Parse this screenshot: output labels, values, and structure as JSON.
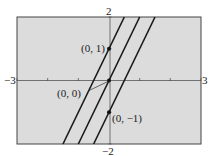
{
  "chart_data": {
    "type": "line",
    "title": "",
    "xlabel": "",
    "ylabel": "",
    "xlim": [
      -3,
      3
    ],
    "ylim": [
      -2,
      2
    ],
    "grid": false,
    "x_tick_labels": {
      "min": "−3",
      "max": "3"
    },
    "y_tick_labels": {
      "min": "−2",
      "max": "2"
    },
    "x_ticks": [
      -3,
      -2,
      -1,
      0,
      1,
      2,
      3
    ],
    "y_ticks": [
      -2,
      -1,
      0,
      1,
      2
    ],
    "series": [
      {
        "name": "y = 2x + 1",
        "slope": 2,
        "intercept": 1,
        "x": [
          -1.5,
          0.5
        ],
        "y": [
          -2,
          2
        ]
      },
      {
        "name": "y = 2x",
        "slope": 2,
        "intercept": 0,
        "x": [
          -1,
          1
        ],
        "y": [
          -2,
          2
        ]
      },
      {
        "name": "y = 2x − 1",
        "slope": 2,
        "intercept": -1,
        "x": [
          -0.5,
          1.5
        ],
        "y": [
          -2,
          2
        ]
      }
    ],
    "annotations": [
      {
        "text": "(0, 1)",
        "point": [
          0,
          1
        ]
      },
      {
        "text": "(0, 0)",
        "point": [
          0,
          0
        ]
      },
      {
        "text": "(0, −1)",
        "point": [
          0,
          -1
        ]
      }
    ],
    "background_color": "#dcdcdc",
    "line_color": "#1a1a1a"
  }
}
